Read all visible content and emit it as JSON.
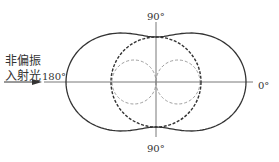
{
  "diagram": {
    "type": "polar-scattering-pattern",
    "incident_label_line1": "非偏振",
    "incident_label_line2": "入射光",
    "angle_labels": {
      "left": "180°",
      "right": "0°",
      "top": "90°",
      "bottom": "90°"
    },
    "center": [
      156,
      82
    ],
    "curves": [
      {
        "name": "total-intensity",
        "style": "solid",
        "formula": "r = 45(1+cos²θ)"
      },
      {
        "name": "perpendicular-component",
        "style": "dashed-bold",
        "formula": "r = 45 (circle)"
      },
      {
        "name": "parallel-component",
        "style": "dashed-thin",
        "formula": "r = 45cos²θ (two lobes)"
      }
    ],
    "colors": {
      "line": "#333333",
      "dashed_thin": "#888888",
      "background": "#ffffff"
    }
  }
}
